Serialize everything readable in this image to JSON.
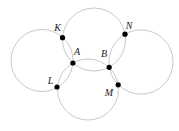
{
  "figure": {
    "kind": "geometry-diagram",
    "canvas": {
      "width": 179,
      "height": 131,
      "background": "#ffffff"
    },
    "style": {
      "circle_stroke_color": "#c9c9c9",
      "circle_stroke_width": 1,
      "dot_color": "#000000",
      "dot_radius": 2.6,
      "label_color": "#1a1a1a"
    },
    "circles": [
      {
        "id": "left-circle",
        "cx": 42,
        "cy": 60.5,
        "r": 31,
        "through_points": "K A L"
      },
      {
        "id": "top-circle",
        "cx": 94,
        "cy": 39.5,
        "r": 31.5,
        "through_points": "K A B N"
      },
      {
        "id": "right-circle",
        "cx": 141,
        "cy": 62,
        "r": 32.1,
        "through_points": "N B M"
      },
      {
        "id": "bottom-circle",
        "cx": 88,
        "cy": 89.5,
        "r": 30.5,
        "through_points": "L A B M"
      }
    ],
    "points": [
      {
        "label": "K",
        "x": 62.5,
        "y": 37.7,
        "label_x": 57.5,
        "label_y": 31
      },
      {
        "label": "N",
        "x": 125.0,
        "y": 34.2,
        "label_x": 129,
        "label_y": 28.5
      },
      {
        "label": "A",
        "x": 72.9,
        "y": 63.0,
        "label_x": 77,
        "label_y": 54.5
      },
      {
        "label": "B",
        "x": 109.2,
        "y": 67.3,
        "label_x": 104,
        "label_y": 57
      },
      {
        "label": "L",
        "x": 57.0,
        "y": 87.0,
        "label_x": 50.5,
        "label_y": 83.5
      },
      {
        "label": "M",
        "x": 118.2,
        "y": 84.8,
        "label_x": 109,
        "label_y": 96
      }
    ]
  }
}
